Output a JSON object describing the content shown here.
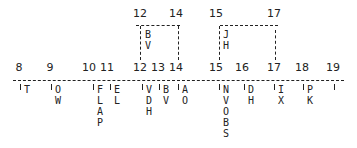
{
  "axis": {
    "ticks": [
      {
        "label": "8",
        "x": 19
      },
      {
        "label": "9",
        "x": 50
      },
      {
        "label": "10",
        "x": 89
      },
      {
        "label": "11",
        "x": 107
      },
      {
        "label": "12",
        "x": 140
      },
      {
        "label": "13",
        "x": 157
      },
      {
        "label": "14",
        "x": 175
      },
      {
        "label": "15",
        "x": 216
      },
      {
        "label": "16",
        "x": 241
      },
      {
        "label": "17",
        "x": 274
      },
      {
        "label": "18",
        "x": 302
      },
      {
        "label": "19",
        "x": 332
      }
    ]
  },
  "intervals": [
    {
      "start": "12",
      "end": "14",
      "letters": [
        "B",
        "V"
      ]
    },
    {
      "start": "15",
      "end": "17",
      "letters": [
        "J",
        "H"
      ]
    }
  ],
  "below_labels": [
    {
      "tick": "8",
      "letters": [
        "T"
      ]
    },
    {
      "tick": "9",
      "letters": [
        "O",
        "W"
      ]
    },
    {
      "tick": "10",
      "letters": [
        "F",
        "L",
        "A",
        "P"
      ]
    },
    {
      "tick": "11",
      "letters": [
        "E",
        "L"
      ]
    },
    {
      "tick": "12",
      "letters": [
        "V",
        "D",
        "H"
      ]
    },
    {
      "tick": "13",
      "letters": [
        "B",
        "V"
      ]
    },
    {
      "tick": "14",
      "letters": [
        "A",
        "O"
      ]
    },
    {
      "tick": "15",
      "letters": [
        "N",
        "V",
        "O",
        "B",
        "S"
      ]
    },
    {
      "tick": "16",
      "letters": [
        "D",
        "H"
      ]
    },
    {
      "tick": "17",
      "letters": [
        "I",
        "X"
      ]
    },
    {
      "tick": "18",
      "letters": [
        "P",
        "K"
      ]
    },
    {
      "tick": "19",
      "letters": []
    }
  ],
  "text": {
    "iv1_start": "12",
    "iv1_end": "14",
    "iv1_l1": "B",
    "iv1_l2": "V",
    "iv2_start": "15",
    "iv2_end": "17",
    "iv2_l1": "J",
    "iv2_l2": "H",
    "t8": "8",
    "t9": "9",
    "t10": "10",
    "t11": "11",
    "t12": "12",
    "t13": "13",
    "t14": "14",
    "t15": "15",
    "t16": "16",
    "t17": "17",
    "t18": "18",
    "t19": "19",
    "b8": "T",
    "b9": "OW",
    "b10": "FLAP",
    "b11": "EL",
    "b12": "VDH",
    "b13": "BV",
    "b14": "AO",
    "b15": "NVOBS",
    "b16": "DH",
    "b17": "IX",
    "b18": "PK"
  }
}
